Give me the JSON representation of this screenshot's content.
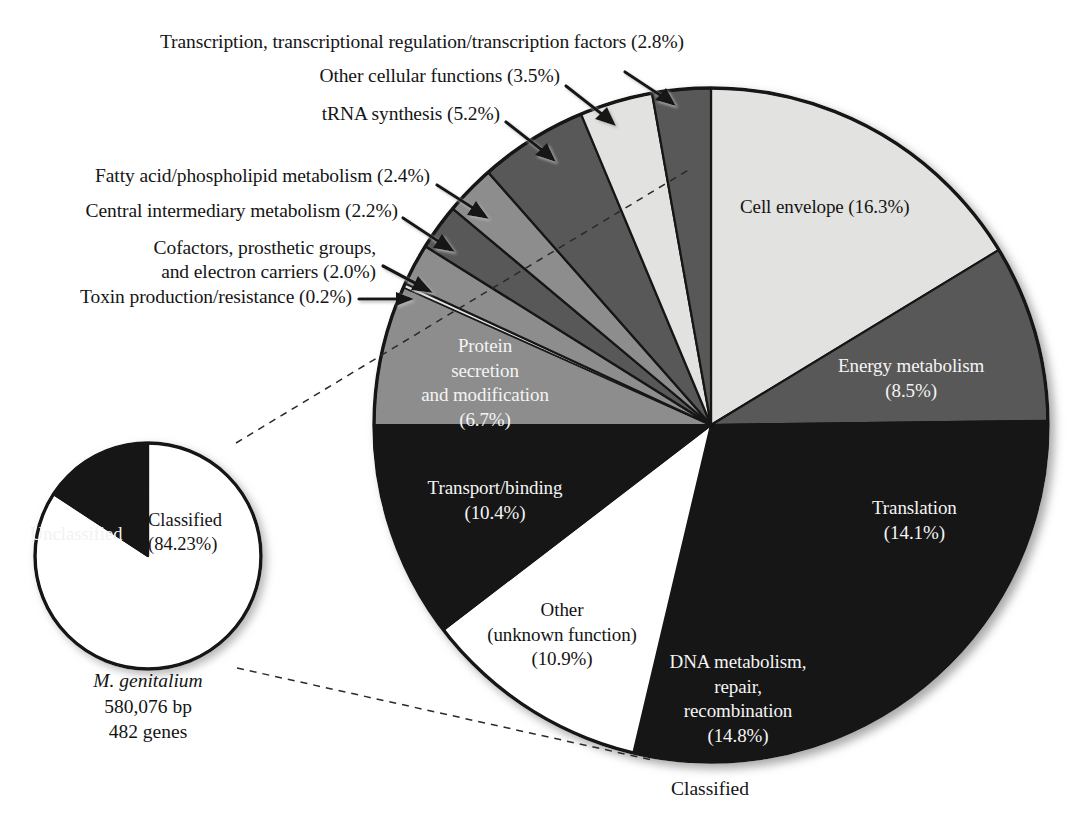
{
  "figure": {
    "bottom_label": "Classified",
    "caption_lines": [
      "M. genitalium",
      "580,076 bp",
      "482 genes"
    ],
    "caption_species": "M. genitalium"
  },
  "colors": {
    "light_gray": "#e2e2e0",
    "mid_gray": "#8d8d8d",
    "dark_gray": "#585858",
    "black": "#141414",
    "white": "#ffffff",
    "outline": "#151515",
    "text_dark": "#141414",
    "text_light": "#f4f4f4"
  },
  "chart_data": [
    {
      "type": "pie",
      "name": "functional-categories-pie",
      "title": "",
      "center": [
        711,
        425
      ],
      "radius": 337,
      "start_angle_deg": 0,
      "direction": "clockwise",
      "total_percent": 100.0,
      "categories": [
        "Cell envelope",
        "Energy metabolism",
        "Translation",
        "DNA metabolism, repair, recombination",
        "Other (unknown function)",
        "Transport/binding",
        "Protein secretion and modification",
        "Toxin production/resistance",
        "Cofactors, prosthetic groups, and electron carriers",
        "Central intermediary metabolism",
        "Fatty acid/phospholipid metabolism",
        "tRNA synthesis",
        "Other cellular functions",
        "Transcription, transcriptional regulation/transcription factors"
      ],
      "values": [
        16.3,
        8.5,
        14.1,
        14.8,
        10.9,
        10.4,
        6.7,
        0.2,
        2.0,
        2.2,
        2.4,
        5.2,
        3.5,
        2.8
      ],
      "slice_fills": [
        "#e2e2e0",
        "#585858",
        "#141414",
        "#141414",
        "#ffffff",
        "#141414",
        "#8d8d8d",
        "#e2e2e0",
        "#8d8d8d",
        "#585858",
        "#8d8d8d",
        "#585858",
        "#e2e2e0",
        "#585858"
      ],
      "legend_position": "none",
      "grid": false
    },
    {
      "type": "pie",
      "name": "classified-unclassified-pie",
      "title": "",
      "center": [
        148,
        556
      ],
      "radius": 113,
      "categories": [
        "Classified",
        "Unclassified"
      ],
      "values": [
        84.23,
        15.77
      ],
      "slice_fills": [
        "#ffffff",
        "#141414"
      ],
      "legend_position": "none",
      "grid": false
    }
  ],
  "callouts": [
    {
      "id": "transcription",
      "text": "Transcription, transcriptional regulation/transcription factors (2.8%)",
      "percent": "2.8%"
    },
    {
      "id": "other-cellular",
      "text": "Other cellular functions (3.5%)",
      "percent": "3.5%"
    },
    {
      "id": "trna",
      "text": "tRNA synthesis (5.2%)",
      "percent": "5.2%"
    },
    {
      "id": "fatty-acid",
      "text": "Fatty acid/phospholipid metabolism (2.4%)",
      "percent": "2.4%"
    },
    {
      "id": "central-intermediary",
      "text": "Central intermediary metabolism (2.2%)",
      "percent": "2.2%"
    },
    {
      "id": "cofactors-line1",
      "text": "Cofactors, prosthetic groups,",
      "percent": "2.0%"
    },
    {
      "id": "cofactors-line2",
      "text": "and electron carriers (2.0%)",
      "percent": "2.0%"
    },
    {
      "id": "toxin",
      "text": "Toxin production/resistance (0.2%)",
      "percent": "0.2%"
    }
  ],
  "slice_labels": {
    "cell_envelope": "Cell envelope (16.3%)",
    "energy_metabolism_l1": "Energy metabolism",
    "energy_metabolism_l2": "(8.5%)",
    "translation_l1": "Translation",
    "translation_l2": "(14.1%)",
    "dna_l1": "DNA metabolism,",
    "dna_l2": "repair,",
    "dna_l3": "recombination",
    "dna_l4": "(14.8%)",
    "other_l1": "Other",
    "other_l2": "(unknown function)",
    "other_l3": "(10.9%)",
    "transport_l1": "Transport/binding",
    "transport_l2": "(10.4%)",
    "protein_l1": "Protein",
    "protein_l2": "secretion",
    "protein_l3": "and modification",
    "protein_l4": "(6.7%)"
  },
  "mini_labels": {
    "unclassified": "Unclassified",
    "classified_l1": "Classified",
    "classified_l2": "(84.23%)"
  }
}
